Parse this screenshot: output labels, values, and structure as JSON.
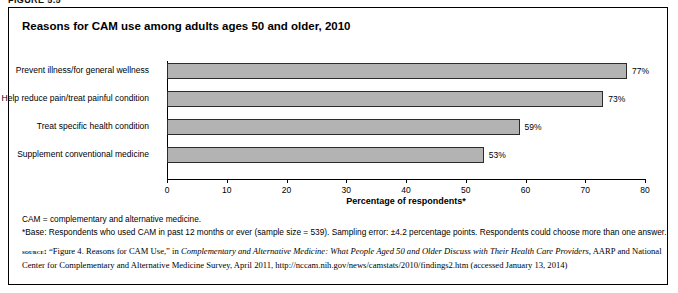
{
  "figure_caption": "FIGURE 5.5",
  "chart_title": "Reasons for CAM use among adults ages 50 and older, 2010",
  "notes": {
    "line1": "CAM = complementary and alternative medicine.",
    "line2": "*Base: Respondents who used CAM in past 12 months or ever (sample size = 539). Sampling error: ±4.2 percentage points. Respondents could choose more than one answer."
  },
  "source": {
    "label": "source:",
    "text_1": " “Figure 4. Reasons for CAM Use,” in ",
    "italic_1": "Complementary and Alternative Medicine: What People Aged 50 and Older Discuss with Their Health Care Providers,",
    "text_2": " AARP and National Center for Complementary and Alternative Medicine Survey, April 2011, http://nccam.nih.gov/news/camstats/2010/findings2.htm (accessed January 13, 2014)"
  },
  "chart_data": {
    "type": "bar",
    "orientation": "horizontal",
    "title": "Reasons for CAM use among adults ages 50 and older, 2010",
    "xlabel": "Percentage of respondents*",
    "ylabel": "",
    "xlim": [
      0,
      80
    ],
    "xticks": [
      0,
      10,
      20,
      30,
      40,
      50,
      60,
      70,
      80
    ],
    "grid": false,
    "legend": "none",
    "bar_color": "#b3b3b3",
    "bar_border_color": "#2b2b2b",
    "categories": [
      "Prevent illness/for general wellness",
      "Help reduce pain/treat painful condition",
      "Treat specific health condition",
      "Supplement conventional medicine"
    ],
    "values": [
      77,
      73,
      59,
      53
    ],
    "value_labels": [
      "77%",
      "73%",
      "59%",
      "53%"
    ]
  }
}
